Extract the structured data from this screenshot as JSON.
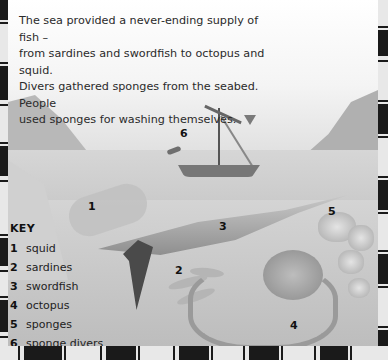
{
  "body_text": "The sea provided a never-ending supply of fish – from sardines and swordfish to octopus and squid. Divers gathered sponges from the seabed. People used sponges for washing themselves.",
  "body_lines": [
    "The sea provided a never-ending supply of fish –",
    "from sardines and swordfish to octopus and squid.",
    "Divers gathered sponges from the seabed. People",
    "used sponges for washing themselves."
  ],
  "pointer_icon": "down-triangle-icon",
  "illustration_labels": [
    {
      "num": "1",
      "x": 88,
      "y": 200
    },
    {
      "num": "2",
      "x": 172,
      "y": 264
    },
    {
      "num": "3",
      "x": 219,
      "y": 220
    },
    {
      "num": "4",
      "x": 290,
      "y": 322
    },
    {
      "num": "5",
      "x": 324,
      "y": 205
    },
    {
      "num": "6",
      "x": 175,
      "y": 127
    }
  ],
  "key": {
    "title": "KEY",
    "items": [
      {
        "num": "1",
        "label": "squid"
      },
      {
        "num": "2",
        "label": "sardines"
      },
      {
        "num": "3",
        "label": "swordfish"
      },
      {
        "num": "4",
        "label": "octopus"
      },
      {
        "num": "5",
        "label": "sponges"
      },
      {
        "num": "6",
        "label": "sponge divers"
      }
    ]
  }
}
